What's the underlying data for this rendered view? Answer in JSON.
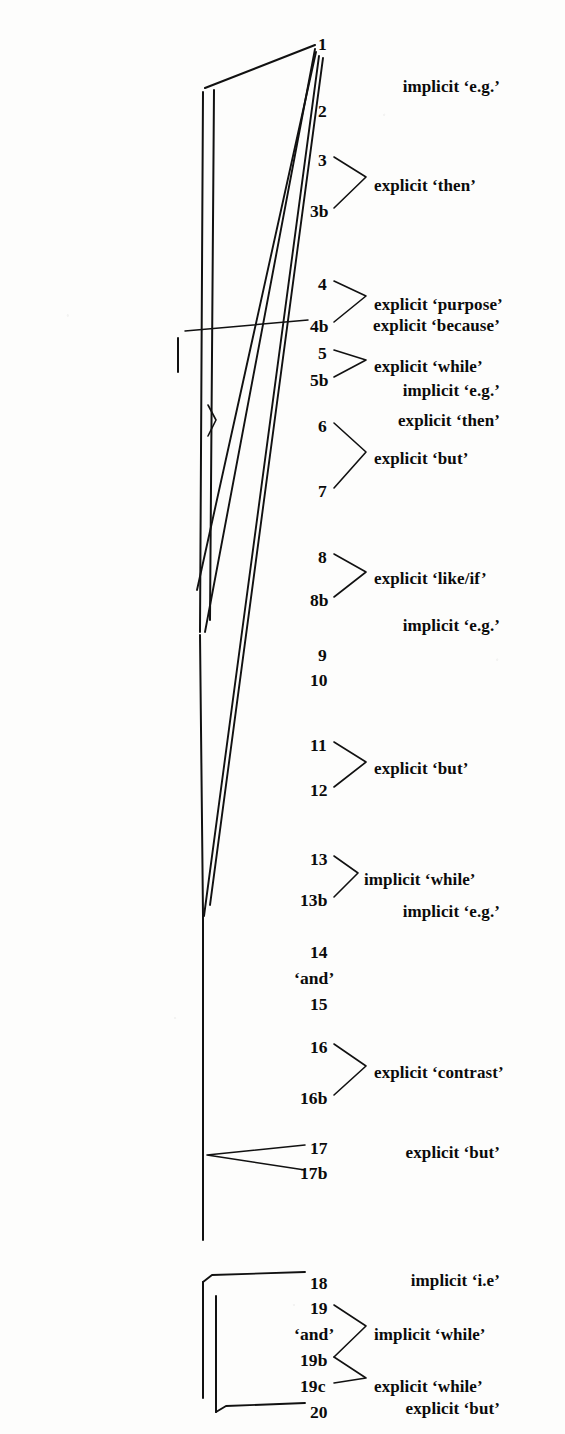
{
  "figure": {
    "ink_color": "#111111",
    "background_color": "#fdfdfc"
  },
  "units": [
    {
      "id": "u1",
      "text": "1",
      "x": 318,
      "y": 36
    },
    {
      "id": "u2",
      "text": "2",
      "x": 318,
      "y": 103
    },
    {
      "id": "u3",
      "text": "3",
      "x": 318,
      "y": 152
    },
    {
      "id": "u3b",
      "text": "3b",
      "x": 310,
      "y": 203
    },
    {
      "id": "u4",
      "text": "4",
      "x": 318,
      "y": 276
    },
    {
      "id": "u4b",
      "text": "4b",
      "x": 310,
      "y": 318
    },
    {
      "id": "u5",
      "text": "5",
      "x": 318,
      "y": 345
    },
    {
      "id": "u5b",
      "text": "5b",
      "x": 310,
      "y": 372
    },
    {
      "id": "u6",
      "text": "6",
      "x": 318,
      "y": 418
    },
    {
      "id": "u7",
      "text": "7",
      "x": 318,
      "y": 483
    },
    {
      "id": "u8",
      "text": "8",
      "x": 318,
      "y": 549
    },
    {
      "id": "u8b",
      "text": "8b",
      "x": 310,
      "y": 592
    },
    {
      "id": "u9",
      "text": "9",
      "x": 318,
      "y": 647
    },
    {
      "id": "u10",
      "text": "10",
      "x": 310,
      "y": 672
    },
    {
      "id": "u11",
      "text": "11",
      "x": 310,
      "y": 737
    },
    {
      "id": "u12",
      "text": "12",
      "x": 310,
      "y": 782
    },
    {
      "id": "u13",
      "text": "13",
      "x": 310,
      "y": 851
    },
    {
      "id": "u13b",
      "text": "13b",
      "x": 300,
      "y": 892
    },
    {
      "id": "u14",
      "text": "14",
      "x": 310,
      "y": 944
    },
    {
      "id": "uand1",
      "text": "‘and’",
      "x": 294,
      "y": 970
    },
    {
      "id": "u15",
      "text": "15",
      "x": 310,
      "y": 996
    },
    {
      "id": "u16",
      "text": "16",
      "x": 310,
      "y": 1039
    },
    {
      "id": "u16b",
      "text": "16b",
      "x": 300,
      "y": 1090
    },
    {
      "id": "u17",
      "text": "17",
      "x": 310,
      "y": 1140
    },
    {
      "id": "u17b",
      "text": "17b",
      "x": 300,
      "y": 1165
    },
    {
      "id": "u18",
      "text": "18",
      "x": 310,
      "y": 1275
    },
    {
      "id": "u19",
      "text": "19",
      "x": 310,
      "y": 1300
    },
    {
      "id": "uand2",
      "text": "‘and’",
      "x": 294,
      "y": 1326
    },
    {
      "id": "u19b",
      "text": "19b",
      "x": 300,
      "y": 1352
    },
    {
      "id": "u19c",
      "text": "19c",
      "x": 300,
      "y": 1378
    },
    {
      "id": "u20",
      "text": "20",
      "x": 310,
      "y": 1404
    }
  ],
  "left_labels": [
    {
      "id": "l1",
      "text": "implicit ‘e.g.’",
      "right": 65,
      "y": 78
    },
    {
      "id": "l2",
      "text": "explicit ‘because’",
      "right": 65,
      "y": 317
    },
    {
      "id": "l3",
      "text": "implicit ‘e.g.’",
      "right": 65,
      "y": 382
    },
    {
      "id": "l4",
      "text": "explicit ‘then’",
      "right": 65,
      "y": 412
    },
    {
      "id": "l5",
      "text": "implicit ‘e.g.’",
      "right": 65,
      "y": 617
    },
    {
      "id": "l6",
      "text": "implicit ‘e.g.’",
      "right": 65,
      "y": 903
    },
    {
      "id": "l7",
      "text": "explicit ‘but’",
      "right": 65,
      "y": 1144
    },
    {
      "id": "l8",
      "text": "implicit ‘i.e’",
      "right": 65,
      "y": 1272
    },
    {
      "id": "l9",
      "text": "explicit ‘but’",
      "right": 65,
      "y": 1400
    }
  ],
  "right_labels": [
    {
      "id": "r1",
      "text": "explicit ‘then’",
      "x": 374,
      "y": 177
    },
    {
      "id": "r2",
      "text": "explicit ‘purpose’",
      "x": 374,
      "y": 296
    },
    {
      "id": "r3",
      "text": "explicit ‘while’",
      "x": 374,
      "y": 358
    },
    {
      "id": "r4",
      "text": "explicit ‘but’",
      "x": 374,
      "y": 450
    },
    {
      "id": "r5",
      "text": "explicit ‘like/if’",
      "x": 374,
      "y": 570
    },
    {
      "id": "r6",
      "text": "explicit ‘but’",
      "x": 374,
      "y": 760
    },
    {
      "id": "r7",
      "text": "implicit ‘while’",
      "x": 364,
      "y": 871
    },
    {
      "id": "r8",
      "text": "explicit ‘contrast’",
      "x": 374,
      "y": 1064
    },
    {
      "id": "r9",
      "text": "implicit ‘while’",
      "x": 374,
      "y": 1326
    },
    {
      "id": "r10",
      "text": "explicit ‘while’",
      "x": 374,
      "y": 1378
    }
  ],
  "strokes": {
    "brackets_right": [
      {
        "name": "bracket-3-3b",
        "points": "334,157 366,177 334,208"
      },
      {
        "name": "bracket-4-4b",
        "points": "334,281 366,296 334,322"
      },
      {
        "name": "bracket-5-5b",
        "points": "334,350 366,360 334,377"
      },
      {
        "name": "bracket-6-7",
        "points": "334,423 366,452 334,488"
      },
      {
        "name": "bracket-8-8b",
        "points": "334,554 366,572 334,597"
      },
      {
        "name": "bracket-11-12",
        "points": "334,742 366,762 334,787"
      },
      {
        "name": "bracket-13-13b",
        "points": "334,856 358,873 334,897"
      },
      {
        "name": "bracket-16-16b",
        "points": "334,1044 366,1066 334,1095"
      },
      {
        "name": "bracket-19-19b",
        "points": "334,1305 366,1326 334,1357"
      },
      {
        "name": "bracket-19b-19c",
        "points": "334,1357 366,1378 334,1383"
      }
    ],
    "bracket_left_but": [
      {
        "name": "bracket-17-17b",
        "points": "305,1145 207,1155 305,1170"
      }
    ],
    "top_frame": {
      "name": "top-frame-eg",
      "points": "205,88 315,45"
    },
    "verticals": [
      {
        "name": "rule-outer-top",
        "x1": 203,
        "y1": 92,
        "x2": 200,
        "y2": 632
      },
      {
        "name": "rule-inner-top",
        "x1": 214,
        "y1": 90,
        "x2": 210,
        "y2": 620
      },
      {
        "name": "rule-main-mid",
        "x1": 200,
        "y1": 635,
        "x2": 203,
        "y2": 915
      },
      {
        "name": "rule-main-lower",
        "x1": 203,
        "y1": 915,
        "x2": 203,
        "y2": 1240
      },
      {
        "name": "rule-ie-left",
        "x1": 203,
        "y1": 1282,
        "x2": 203,
        "y2": 1398
      },
      {
        "name": "rule-but-inner",
        "x1": 216,
        "y1": 1296,
        "x2": 216,
        "y2": 1412
      },
      {
        "name": "tick-because",
        "x1": 178,
        "y1": 338,
        "x2": 178,
        "y2": 372
      }
    ],
    "diagonals": [
      {
        "name": "diag-1-to-630",
        "x1": 315,
        "y1": 49,
        "x2": 205,
        "y2": 632
      },
      {
        "name": "diag-1-to-585",
        "x1": 316,
        "y1": 52,
        "x2": 197,
        "y2": 590
      },
      {
        "name": "diag-1-to-915",
        "x1": 319,
        "y1": 56,
        "x2": 204,
        "y2": 916
      },
      {
        "name": "diag-1-to-905",
        "x1": 323,
        "y1": 58,
        "x2": 210,
        "y2": 905
      }
    ],
    "leader_because": {
      "name": "leader-because",
      "x1": 185,
      "y1": 331,
      "x2": 308,
      "y2": 320
    },
    "brace_then": {
      "name": "brace-then",
      "points": "208,405 216,420 208,436"
    },
    "connector_18": {
      "name": "connector-18",
      "points": "203,1282 212,1275 305,1272"
    },
    "connector_20": {
      "name": "connector-20",
      "points": "216,1412 226,1406 305,1403"
    }
  }
}
